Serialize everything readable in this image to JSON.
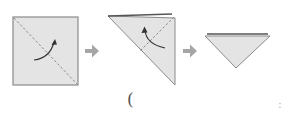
{
  "diagram": {
    "type": "origami-fold-steps",
    "colors": {
      "paper_fill": "#e4e4e4",
      "outline": "#8a8a8a",
      "edge_dark": "#555555",
      "dash_line": "#8a8a8a",
      "fold_arrow": "#333333",
      "step_arrow": "#a6a6a6"
    },
    "steps": [
      {
        "name": "square-with-diagonal-fold",
        "fold": "diagonal",
        "arrow": "curved-up-right"
      },
      {
        "name": "large-triangle-with-fold-line",
        "fold": "half",
        "arrow": "curved-up-left"
      },
      {
        "name": "small-triangle-result"
      }
    ],
    "step_arrows": [
      {
        "from": 1,
        "to": 2,
        "direction": "right"
      },
      {
        "from": 2,
        "to": 3,
        "direction": "right"
      }
    ]
  },
  "caption": {
    "open": "(",
    "close": ":"
  }
}
